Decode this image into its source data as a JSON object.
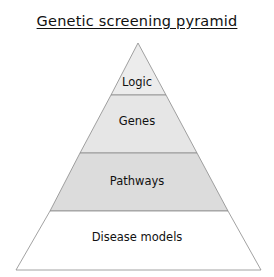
{
  "title": "Genetic screening pyramid",
  "pyramid": {
    "levels": [
      {
        "label": "Logic",
        "fill": "#ececec"
      },
      {
        "label": "Genes",
        "fill": "#e6e6e6"
      },
      {
        "label": "Pathways",
        "fill": "#dcdcdc"
      },
      {
        "label": "Disease models",
        "fill": "#ffffff"
      }
    ],
    "stroke": "#8a8a8a"
  }
}
